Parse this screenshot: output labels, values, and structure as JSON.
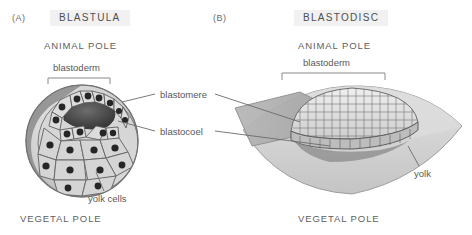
{
  "figure": {
    "background": "#ffffff",
    "text_color": "#58585a",
    "title_highlight": "#f1f1f1"
  },
  "panels": [
    {
      "letter": "(A)",
      "title": "BLASTULA",
      "animal_pole": "ANIMAL POLE",
      "vegetal_pole": "VEGETAL POLE",
      "bracket_label": "blastoderm",
      "structure_labels": [
        "yolk cells"
      ]
    },
    {
      "letter": "(B)",
      "title": "BLASTODISC",
      "animal_pole": "ANIMAL POLE",
      "vegetal_pole": "VEGETAL POLE",
      "bracket_label": "blastoderm",
      "structure_labels": [
        "yolk"
      ]
    }
  ],
  "shared_labels": {
    "blastomere": "blastomere",
    "blastocoel": "blastocoel"
  },
  "colors": {
    "cell_fill": "#d3d3d3",
    "cell_stroke": "#6e6e6e",
    "nucleus": "#2b2b2b",
    "cavity": "#4a4a4a",
    "sphere_shadow": "#8e8e8e",
    "yolk_light": "#d8d8d8",
    "yolk_mid": "#c2c2c2",
    "cut_plane": "#a9a9a9",
    "leader_line": "#6b6b6b"
  }
}
